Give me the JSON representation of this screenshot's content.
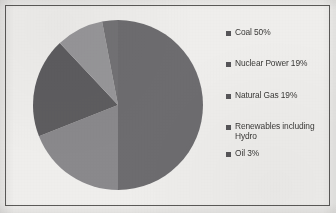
{
  "document": {
    "kind": "scanned-page-pie-chart"
  },
  "chart_data": {
    "type": "pie",
    "title": "",
    "subtitle": "",
    "xlabel": "",
    "ylabel": "",
    "grid": false,
    "legend_position": "right",
    "start_angle_deg": 0,
    "direction": "clockwise",
    "categories": [
      "Coal",
      "Nuclear Power",
      "Natural Gas",
      "Renewables including Hydro",
      "Oil"
    ],
    "values": [
      50,
      19,
      19,
      9,
      3
    ],
    "labels": [
      "Coal 50%",
      "Nuclear Power 19%",
      "Natural Gas 19%",
      "Renewables including Hydro",
      "Oil 3%"
    ],
    "colors": [
      "#6f6e71",
      "#5f5e61",
      "#8c8b8e",
      "#9a999c",
      "#757477"
    ],
    "slices": [
      {
        "name": "Coal",
        "label": "Coal 50%",
        "value": 50,
        "color": "#6f6e71",
        "start_deg": 0,
        "end_deg": 180
      },
      {
        "name": "Natural Gas",
        "label": "Natural Gas 19%",
        "value": 19,
        "color": "#8c8b8e",
        "start_deg": 180,
        "end_deg": 248.4
      },
      {
        "name": "Nuclear Power",
        "label": "Nuclear Power 19%",
        "value": 19,
        "color": "#5f5e61",
        "start_deg": 248.4,
        "end_deg": 316.8
      },
      {
        "name": "Renewables including Hydro",
        "label": "Renewables including Hydro",
        "value": 9,
        "color": "#9a999c",
        "start_deg": 316.8,
        "end_deg": 349.2
      },
      {
        "name": "Oil",
        "label": "Oil 3%",
        "value": 3,
        "color": "#757477",
        "start_deg": 349.2,
        "end_deg": 360
      }
    ]
  },
  "legend": {
    "items": [
      {
        "label": "Coal 50%",
        "color": "#58575a"
      },
      {
        "label": "Nuclear Power 19%",
        "color": "#58575a"
      },
      {
        "label": "Natural Gas 19%",
        "color": "#58575a"
      },
      {
        "label": "Renewables including\nHydro",
        "color": "#58575a"
      },
      {
        "label": "Oil 3%",
        "color": "#58575a"
      }
    ]
  },
  "colors": {
    "page_background": "#f2f1ef",
    "plot_background": "#f3f2f0",
    "frame_border": "#5d5c5a",
    "text": "#3b3a38"
  }
}
